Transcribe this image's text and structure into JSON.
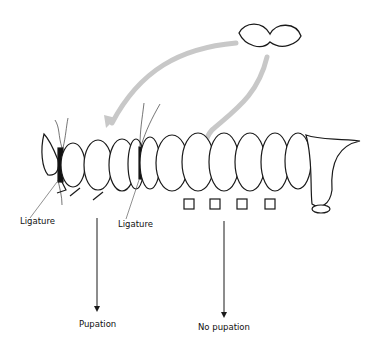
{
  "figure": {
    "labels": {
      "ligature_left": "Ligature",
      "ligature_middle": "Ligature",
      "outcome_left": "Pupation",
      "outcome_right": "No pupation"
    },
    "elements": {
      "gland": "brain-gland (paired lobes)",
      "larva": "caterpillar with two ligatures"
    },
    "colors": {
      "outline": "#1a1a1a",
      "arrow_gray": "#c8c8c8",
      "background": "#ffffff"
    }
  }
}
